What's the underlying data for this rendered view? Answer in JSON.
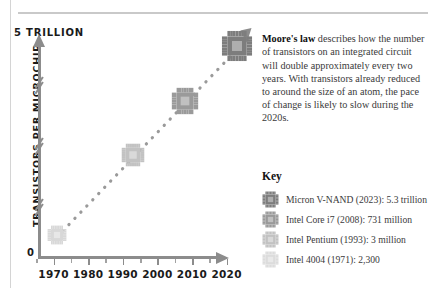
{
  "chart_data": {
    "type": "scatter",
    "title": "",
    "xlabel": "",
    "ylabel": "TRANSISTORS PER MICROCHIP",
    "y_top_label": "5 TRILLION",
    "y_zero_label": "0",
    "ylim": [
      0,
      5300000000000
    ],
    "xlim": [
      1965,
      2026
    ],
    "grid": false,
    "axis_breaks": 3,
    "trend": "dotted ascending line with arrowhead",
    "x_ticks": [
      "1970",
      "1980",
      "1990",
      "2000",
      "2010",
      "2020"
    ],
    "x_tick_values": [
      1970,
      1980,
      1990,
      2000,
      2010,
      2020
    ],
    "points": [
      {
        "label": "Intel 4004",
        "year": 1971,
        "value_text": "2,300",
        "value": 2300,
        "color": "#d8d8d8"
      },
      {
        "label": "Intel Pentium",
        "year": 1993,
        "value_text": "3 million",
        "value": 3000000,
        "color": "#c2c2c2"
      },
      {
        "label": "Intel Core i7",
        "year": 2008,
        "value_text": "731 million",
        "value": 731000000,
        "color": "#9a9a9a"
      },
      {
        "label": "Micron V-NAND",
        "year": 2023,
        "value_text": "5.3 trillion",
        "value": 5300000000000,
        "color": "#7d7d7d"
      }
    ]
  },
  "article": {
    "lead_in": "Moore's law",
    "body": " describes how the number of transistors on an integrated circuit will double approximately every two years. With transistors already reduced to around the size of an atom, the pace of change is likely to slow during the 2020s."
  },
  "key": {
    "title": "Key",
    "items": [
      {
        "label": "Micron V-NAND (2023): 5.3 trillion",
        "color": "#7d7d7d",
        "icon": "microchip-icon"
      },
      {
        "label": "Intel Core i7 (2008): 731 million",
        "color": "#9a9a9a",
        "icon": "microchip-icon"
      },
      {
        "label": "Intel Pentium (1993): 3 million",
        "color": "#c2c2c2",
        "icon": "microchip-icon"
      },
      {
        "label": "Intel 4004 (1971): 2,300",
        "color": "#dcdcdc",
        "icon": "microchip-icon"
      }
    ]
  },
  "colors": {
    "axis": "#8c8c8c",
    "text": "#3a3a3a",
    "heading": "#111111",
    "rule": "#c9c9c9"
  }
}
